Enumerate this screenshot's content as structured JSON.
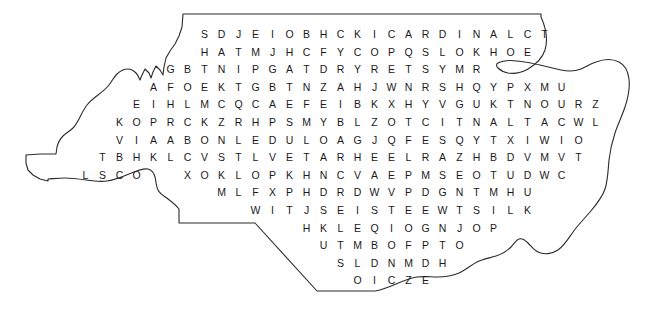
{
  "puzzle": {
    "shape_name": "north-carolina",
    "outline_color": "#2b2b2b",
    "letter_color": "#1a1a1a",
    "background_color": "#ffffff",
    "cell_width": 17,
    "row_height": 17.6,
    "grid_origin_x": 196,
    "grid_origin_y": 26,
    "rows": [
      {
        "col": 0,
        "letters": [
          "S",
          "D",
          "J",
          "E",
          "I",
          "O",
          "B",
          "H",
          "C",
          "K",
          "I",
          "C",
          "A",
          "R",
          "D",
          "I",
          "N",
          "A",
          "L",
          "C",
          "T"
        ]
      },
      {
        "col": 0,
        "letters": [
          "H",
          "A",
          "T",
          "M",
          "J",
          "H",
          "C",
          "F",
          "Y",
          "C",
          "O",
          "P",
          "Q",
          "S",
          "L",
          "O",
          "K",
          "H",
          "O",
          "E"
        ]
      },
      {
        "col": -2,
        "letters": [
          "G",
          "B",
          "T",
          "N",
          "I",
          "P",
          "G",
          "A",
          "T",
          "D",
          "R",
          "Y",
          "R",
          "E",
          "T",
          "S",
          "Y",
          "M",
          "R"
        ]
      },
      {
        "col": -3,
        "letters": [
          "A",
          "F",
          "O",
          "E",
          "K",
          "T",
          "G",
          "B",
          "T",
          "N",
          "Z",
          "A",
          "H",
          "J",
          "W",
          "N",
          "R",
          "S",
          "H",
          "Q",
          "Y",
          "P",
          "X",
          "M",
          "U"
        ]
      },
      {
        "col": -4,
        "letters": [
          "E",
          "I",
          "H",
          "L",
          "M",
          "C",
          "Q",
          "C",
          "A",
          "E",
          "F",
          "E",
          "I",
          "B",
          "K",
          "X",
          "H",
          "Y",
          "V",
          "G",
          "U",
          "K",
          "T",
          "N",
          "O",
          "U",
          "R",
          "Z"
        ]
      },
      {
        "col": -5,
        "letters": [
          "K",
          "O",
          "P",
          "R",
          "C",
          "K",
          "Z",
          "R",
          "H",
          "P",
          "S",
          "M",
          "Y",
          "B",
          "L",
          "Z",
          "O",
          "T",
          "C",
          "I",
          "T",
          "N",
          "A",
          "L",
          "T",
          "A",
          "C",
          "W",
          "L"
        ]
      },
      {
        "col": -5,
        "letters": [
          "V",
          "I",
          "A",
          "A",
          "B",
          "O",
          "N",
          "L",
          "E",
          "D",
          "U",
          "L",
          "O",
          "A",
          "G",
          "J",
          "Q",
          "F",
          "E",
          "S",
          "Q",
          "Y",
          "T",
          "X",
          "I",
          "W",
          "I",
          "O"
        ]
      },
      {
        "col": -6,
        "letters": [
          "T",
          "B",
          "H",
          "K",
          "L",
          "C",
          "V",
          "S",
          "T",
          "L",
          "V",
          "E",
          "T",
          "A",
          "R",
          "H",
          "E",
          "E",
          "L",
          "R",
          "A",
          "Z",
          "H",
          "B",
          "D",
          "V",
          "M",
          "V",
          "T"
        ]
      },
      {
        "col": -7,
        "letters": [
          "L",
          "S",
          "C",
          "O",
          "",
          "",
          "X",
          "O",
          "K",
          "L",
          "O",
          "P",
          "K",
          "H",
          "N",
          "C",
          "V",
          "A",
          "E",
          "P",
          "M",
          "S",
          "E",
          "O",
          "T",
          "U",
          "D",
          "W",
          "C"
        ]
      },
      {
        "col": 1,
        "letters": [
          "M",
          "L",
          "F",
          "X",
          "P",
          "H",
          "D",
          "R",
          "D",
          "W",
          "V",
          "P",
          "D",
          "G",
          "N",
          "T",
          "M",
          "H",
          "U"
        ]
      },
      {
        "col": 3,
        "letters": [
          "W",
          "I",
          "T",
          "J",
          "S",
          "E",
          "I",
          "S",
          "T",
          "E",
          "E",
          "W",
          "T",
          "S",
          "I",
          "L",
          "K"
        ]
      },
      {
        "col": 6,
        "letters": [
          "H",
          "K",
          "L",
          "E",
          "Q",
          "I",
          "O",
          "G",
          "N",
          "J",
          "O",
          "P"
        ]
      },
      {
        "col": 7,
        "letters": [
          "U",
          "T",
          "M",
          "B",
          "O",
          "F",
          "P",
          "T",
          "O"
        ]
      },
      {
        "col": 8,
        "letters": [
          "S",
          "L",
          "D",
          "N",
          "M",
          "D",
          "H"
        ]
      },
      {
        "col": 9,
        "letters": [
          "O",
          "I",
          "C",
          "Z",
          "E"
        ]
      }
    ],
    "outline_path": "M 183 14 L 541 14 L 541 17 C 546 28 548 40 545 50 C 542 59 535 65 528 69 C 521 73 514 74 508 73 C 503 72 500 70 498 68 C 496 66 496 64 498 63 C 503 60 514 60 525 62 C 538 64 551 68 561 70 C 570 72 576 71 581 69 C 586 67 590 64 596 62 C 604 59 613 59 619 62 C 625 65 628 71 629 79 C 630 88 628 98 625 107 C 622 116 618 124 615 133 C 612 142 610 151 609 160 C 608 170 608 180 605 189 C 602 198 596 205 590 212 C 584 219 578 225 573 232 C 568 239 564 246 558 250 C 552 254 544 255 538 252 C 534 250 531 246 528 243 C 525 240 522 238 519 239 C 516 240 514 244 511 247 C 507 251 502 254 496 256 C 490 258 483 259 477 262 C 471 265 466 270 459 273 C 452 276 444 277 437 277 C 430 277 424 276 417 277 C 410 278 403 281 396 284 C 389 287 382 290 375 291 L 317 291 L 255 223 L 179 223 L 179 209 C 176 205 172 202 168 199 C 164 196 160 194 158 190 C 156 186 156 181 155 177 C 154 173 152 170 148 169 C 143 168 136 171 129 174 C 122 177 114 180 107 181 C 100 182 93 181 86 180 C 79 179 72 178 65 178 C 58 178 51 179 48 179 L 48 181 L 40 179 L 33 175 L 28 170 L 26 163 L 26 155 L 40 154 L 56 154 L 57 147 C 58 143 60 139 63 136 C 66 133 70 131 73 128 C 76 125 78 121 80 117 C 82 113 84 109 87 105 C 90 101 94 98 98 95 C 102 92 106 89 109 85 C 112 81 114 77 117 74 C 120 71 124 69 128 69 C 131 69 134 71 136 73 C 138 75 139 78 140 80 L 142 75 L 145 69 L 149 73 L 151 78 L 153 72 L 156 66 L 160 70 L 163 75 L 164 67 L 166 58 L 170 51 L 175 44 L 179 36 L 182 27 Z"
  }
}
